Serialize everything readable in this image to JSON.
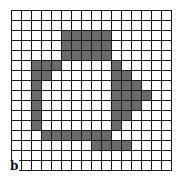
{
  "figure": {
    "panel_label": "b",
    "rows": 16,
    "cols": 16,
    "fill_color": "#6b6b6b",
    "line_color": "#1a1a1a",
    "shaded_cells": [
      [
        2,
        5
      ],
      [
        2,
        6
      ],
      [
        2,
        7
      ],
      [
        2,
        8
      ],
      [
        2,
        9
      ],
      [
        3,
        5
      ],
      [
        3,
        6
      ],
      [
        3,
        7
      ],
      [
        3,
        8
      ],
      [
        3,
        9
      ],
      [
        4,
        5
      ],
      [
        4,
        6
      ],
      [
        4,
        7
      ],
      [
        4,
        8
      ],
      [
        4,
        9
      ],
      [
        5,
        2
      ],
      [
        5,
        3
      ],
      [
        5,
        4
      ],
      [
        5,
        10
      ],
      [
        6,
        2
      ],
      [
        6,
        3
      ],
      [
        6,
        10
      ],
      [
        6,
        11
      ],
      [
        7,
        2
      ],
      [
        7,
        10
      ],
      [
        7,
        11
      ],
      [
        7,
        12
      ],
      [
        8,
        2
      ],
      [
        8,
        10
      ],
      [
        8,
        11
      ],
      [
        8,
        12
      ],
      [
        8,
        13
      ],
      [
        9,
        2
      ],
      [
        9,
        10
      ],
      [
        9,
        11
      ],
      [
        9,
        12
      ],
      [
        10,
        2
      ],
      [
        10,
        10
      ],
      [
        10,
        11
      ],
      [
        11,
        2
      ],
      [
        11,
        10
      ],
      [
        12,
        3
      ],
      [
        12,
        4
      ],
      [
        12,
        5
      ],
      [
        12,
        6
      ],
      [
        12,
        7
      ],
      [
        12,
        8
      ],
      [
        12,
        9
      ],
      [
        13,
        8
      ],
      [
        13,
        9
      ],
      [
        13,
        10
      ],
      [
        13,
        11
      ]
    ]
  }
}
